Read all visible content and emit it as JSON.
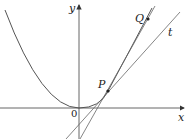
{
  "diagram": {
    "labels": {
      "x_axis": "x",
      "y_axis": "y",
      "origin": "0",
      "point_p": "P",
      "point_q": "Q",
      "tangent": "t"
    },
    "elements": [
      "parabola",
      "tangent line t at P",
      "secant line PQ",
      "x-axis",
      "y-axis"
    ],
    "colors": {
      "stroke": "#555555",
      "text": "#222222",
      "background": "#ffffff"
    }
  }
}
